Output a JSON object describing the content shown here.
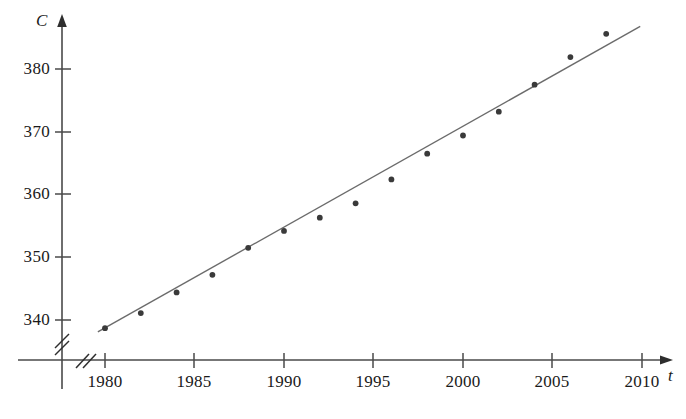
{
  "chart_data": {
    "type": "scatter",
    "title": "",
    "xlabel": "t",
    "ylabel": "C",
    "x": [
      1980,
      1982,
      1984,
      1986,
      1988,
      1990,
      1992,
      1994,
      1996,
      1998,
      2000,
      2002,
      2004,
      2006,
      2008
    ],
    "values": [
      338.7,
      341.1,
      344.4,
      347.2,
      351.5,
      354.2,
      356.3,
      358.6,
      362.4,
      366.5,
      369.4,
      373.2,
      377.5,
      381.9,
      385.6
    ],
    "series": [
      {
        "name": "CO2 concentration",
        "type": "scatter",
        "x": [
          1980,
          1982,
          1984,
          1986,
          1988,
          1990,
          1992,
          1994,
          1996,
          1998,
          2000,
          2002,
          2004,
          2006,
          2008
        ],
        "values": [
          338.7,
          341.1,
          344.4,
          347.2,
          351.5,
          354.2,
          356.3,
          358.6,
          362.4,
          366.5,
          369.4,
          373.2,
          377.5,
          381.9,
          385.6
        ]
      },
      {
        "name": "regression line",
        "type": "line",
        "x": [
          1979.6,
          2009.9
        ],
        "values": [
          338.1,
          386.8
        ]
      }
    ],
    "xlim": [
      1978.3,
      2011.6
    ],
    "ylim": [
      336.8,
      389.3
    ],
    "xticks": [
      1980,
      1985,
      1990,
      1995,
      2000,
      2005,
      2010
    ],
    "yticks": [
      340,
      350,
      360,
      370,
      380
    ],
    "xtick_labels": [
      "1980",
      "1985",
      "1990",
      "1995",
      "2000",
      "2005",
      "2010"
    ],
    "ytick_labels": [
      "340",
      "350",
      "360",
      "370",
      "380"
    ],
    "grid": false,
    "legend": "none",
    "axis_break_x": true,
    "axis_break_y": true,
    "annotations": []
  },
  "axes": {
    "x_axis_label": "t",
    "y_axis_label": "C"
  },
  "colors": {
    "axis": "#4a4a4a",
    "line": "#6b6b6b",
    "point": "#3a3a3a",
    "text": "#1a1a1a",
    "background": "#ffffff"
  }
}
